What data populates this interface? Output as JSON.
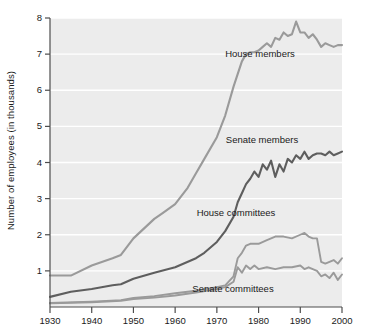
{
  "chart_data": {
    "type": "line",
    "title": "",
    "xlabel": "",
    "ylabel": "Number of employees (in thousands)",
    "xlim": [
      1930,
      2000
    ],
    "ylim": [
      0,
      8
    ],
    "xticks": [
      1930,
      1940,
      1950,
      1960,
      1970,
      1980,
      1990,
      2000
    ],
    "yticks": [
      1,
      2,
      3,
      4,
      5,
      6,
      7,
      8
    ],
    "grid": "horizontal",
    "legend_position": "inline-annotations",
    "plot_background": "#ececec",
    "gridline_color": "#ffffff",
    "series": [
      {
        "name": "House members",
        "color": "#9a9a9a",
        "label": "House members",
        "x": [
          1930,
          1935,
          1940,
          1945,
          1947,
          1950,
          1955,
          1957,
          1960,
          1963,
          1965,
          1967,
          1970,
          1972,
          1974,
          1976,
          1977,
          1978,
          1979,
          1980,
          1981,
          1982,
          1983,
          1984,
          1985,
          1986,
          1987,
          1988,
          1989,
          1990,
          1991,
          1992,
          1993,
          1994,
          1995,
          1996,
          1997,
          1998,
          1999,
          2000
        ],
        "values": [
          0.87,
          0.87,
          1.15,
          1.35,
          1.44,
          1.9,
          2.44,
          2.6,
          2.85,
          3.3,
          3.7,
          4.1,
          4.7,
          5.3,
          6.1,
          6.8,
          7.0,
          7.05,
          7.05,
          7.1,
          7.2,
          7.3,
          7.2,
          7.45,
          7.4,
          7.6,
          7.5,
          7.55,
          7.9,
          7.6,
          7.6,
          7.45,
          7.55,
          7.4,
          7.2,
          7.3,
          7.25,
          7.2,
          7.25,
          7.25
        ]
      },
      {
        "name": "Senate members",
        "color": "#5e5e5e",
        "label": "Senate members",
        "x": [
          1930,
          1935,
          1940,
          1945,
          1947,
          1950,
          1955,
          1960,
          1965,
          1967,
          1970,
          1972,
          1974,
          1975,
          1976,
          1977,
          1978,
          1979,
          1980,
          1981,
          1982,
          1983,
          1984,
          1985,
          1986,
          1987,
          1988,
          1989,
          1990,
          1991,
          1992,
          1993,
          1994,
          1995,
          1996,
          1997,
          1998,
          1999,
          2000
        ],
        "values": [
          0.28,
          0.42,
          0.5,
          0.6,
          0.63,
          0.78,
          0.95,
          1.1,
          1.35,
          1.5,
          1.8,
          2.1,
          2.5,
          2.9,
          3.15,
          3.4,
          3.55,
          3.75,
          3.6,
          3.95,
          3.8,
          4.05,
          3.6,
          3.95,
          3.75,
          4.1,
          4.0,
          4.2,
          4.1,
          4.3,
          4.1,
          4.2,
          4.25,
          4.25,
          4.2,
          4.3,
          4.2,
          4.25,
          4.3
        ]
      },
      {
        "name": "House committees",
        "color": "#9a9a9a",
        "label": "House committees",
        "x": [
          1930,
          1940,
          1947,
          1950,
          1955,
          1960,
          1965,
          1970,
          1972,
          1974,
          1975,
          1976,
          1977,
          1978,
          1980,
          1982,
          1984,
          1986,
          1988,
          1990,
          1991,
          1992,
          1993,
          1994,
          1995,
          1996,
          1997,
          1998,
          1999,
          2000
        ],
        "values": [
          0.11,
          0.15,
          0.19,
          0.25,
          0.3,
          0.38,
          0.45,
          0.55,
          0.6,
          0.85,
          1.35,
          1.5,
          1.7,
          1.75,
          1.75,
          1.85,
          1.95,
          1.95,
          1.9,
          2.0,
          2.05,
          1.95,
          1.9,
          1.9,
          1.25,
          1.2,
          1.25,
          1.3,
          1.2,
          1.35
        ]
      },
      {
        "name": "Senate committees",
        "color": "#9a9a9a",
        "label": "Senate committees",
        "x": [
          1930,
          1940,
          1947,
          1950,
          1955,
          1960,
          1965,
          1970,
          1972,
          1974,
          1975,
          1976,
          1977,
          1978,
          1979,
          1980,
          1982,
          1984,
          1986,
          1988,
          1990,
          1991,
          1992,
          1993,
          1994,
          1995,
          1996,
          1997,
          1998,
          1999,
          2000
        ],
        "values": [
          0.1,
          0.13,
          0.17,
          0.22,
          0.26,
          0.32,
          0.4,
          0.5,
          0.55,
          0.7,
          1.1,
          0.95,
          1.15,
          1.05,
          1.15,
          1.05,
          1.1,
          1.05,
          1.1,
          1.1,
          1.15,
          1.05,
          1.1,
          1.05,
          1.0,
          0.85,
          0.9,
          0.8,
          0.95,
          0.75,
          0.9
        ]
      }
    ],
    "annotations": [
      {
        "text": "House members",
        "x_px": 260,
        "y_px": 48
      },
      {
        "text": "Senate members",
        "x_px": 262,
        "y_px": 134
      },
      {
        "text": "House committees",
        "x_px": 236,
        "y_px": 207
      },
      {
        "text": "Senate committees",
        "x_px": 233,
        "y_px": 283
      }
    ]
  },
  "axis": {
    "ylabel": "Number of employees (in thousands)",
    "ytick_labels": [
      "8",
      "7",
      "6",
      "5",
      "4",
      "3",
      "2",
      "1"
    ],
    "xtick_labels": [
      "1930",
      "1940",
      "1950",
      "1960",
      "1970",
      "1980",
      "1990",
      "2000"
    ]
  }
}
